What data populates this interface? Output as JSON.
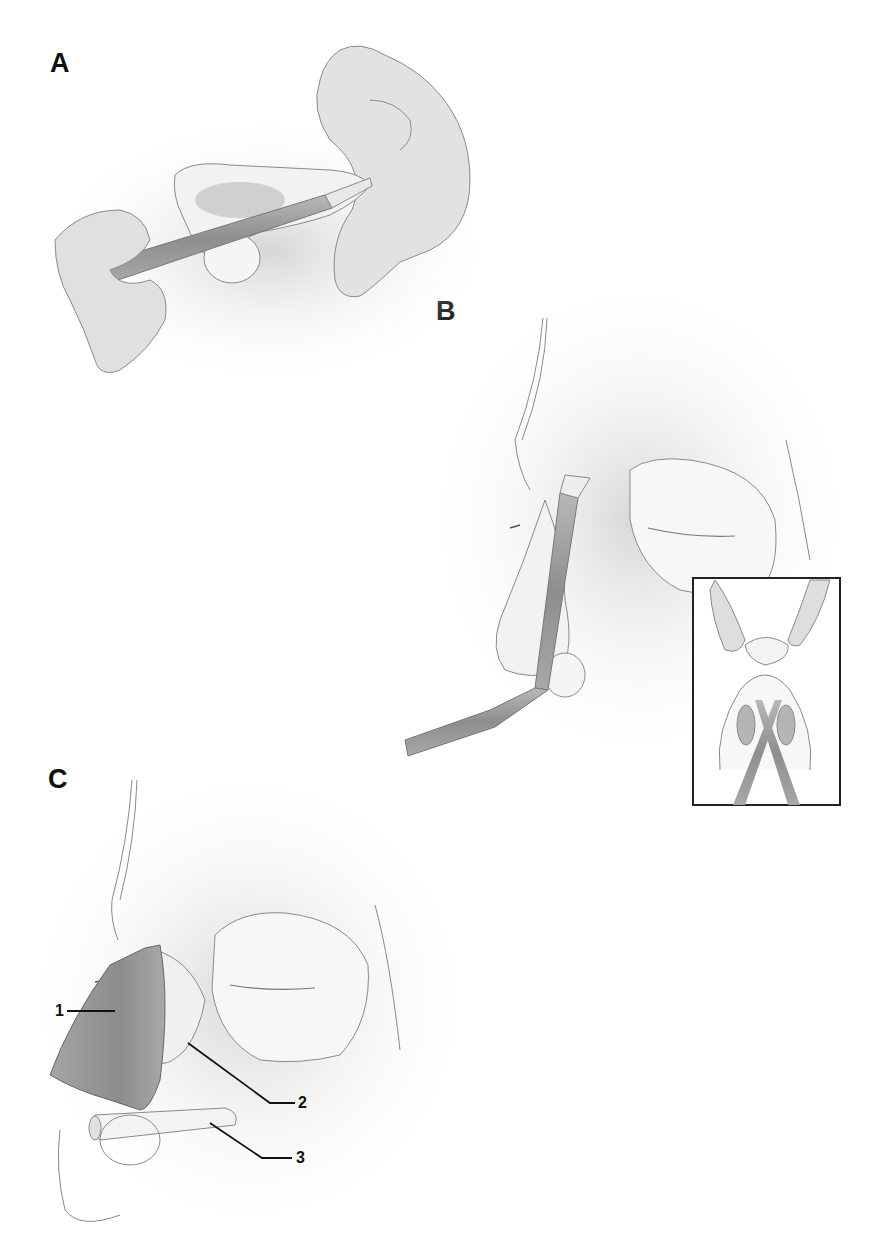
{
  "figure": {
    "panels": [
      {
        "id": "A",
        "label": "A",
        "description": "Hands holding an instrument inserted through the nostril"
      },
      {
        "id": "B",
        "label": "B",
        "description": "Angled instrument inserted along the nasal dorsum, with an inset showing a basal view of the nostrils"
      },
      {
        "id": "C",
        "label": "C",
        "description": "Side view of the nose with numbered structures"
      }
    ],
    "callouts": [
      {
        "number": "1"
      },
      {
        "number": "2"
      },
      {
        "number": "3"
      }
    ],
    "inset": {
      "panel": "B",
      "view": "basal view of the nose with the instrument"
    },
    "colors": {
      "line": "#8a8a8a",
      "shade": "#cfcfcf",
      "dark_shade": "#9a9a9a",
      "label": "#111111",
      "inset_border": "#222222"
    }
  }
}
